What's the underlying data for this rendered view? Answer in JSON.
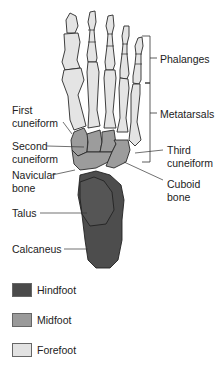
{
  "figure": {
    "labels": {
      "phalanges": "Phalanges",
      "metatarsals": "Metatarsals",
      "first_cuneiform": [
        "First",
        "cuneiform"
      ],
      "second_cuneiform": [
        "Second",
        "cuneiform"
      ],
      "navicular": [
        "Navicular",
        "bone"
      ],
      "third_cuneiform": [
        "Third",
        "cuneiform"
      ],
      "cuboid": [
        "Cuboid",
        "bone"
      ],
      "talus": "Talus",
      "calcaneus": "Calcaneus"
    },
    "legend": [
      {
        "label": "Hindfoot",
        "color": "#4a4a4a"
      },
      {
        "label": "Midfoot",
        "color": "#9a9a9a"
      },
      {
        "label": "Forefoot",
        "color": "#e2e2e2"
      }
    ],
    "colors": {
      "hindfoot": "#4a4a4a",
      "midfoot": "#9a9a9a",
      "forefoot": "#e2e2e2",
      "outline": "#2a2a2a",
      "leader": "#333333"
    }
  }
}
